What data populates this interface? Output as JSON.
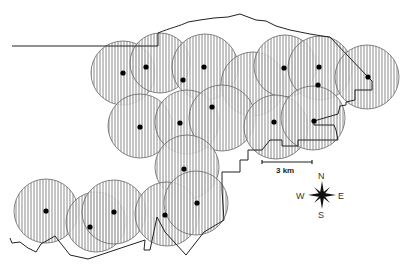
{
  "map": {
    "width": 412,
    "height": 271,
    "hatch_color": "#777777",
    "circle_stroke": "#666666",
    "line_color": "#222222",
    "dot_color": "#000000",
    "circles": [
      {
        "cx": 123,
        "cy": 73,
        "r": 32
      },
      {
        "cx": 160,
        "cy": 63,
        "r": 30
      },
      {
        "cx": 205,
        "cy": 67,
        "r": 33
      },
      {
        "cx": 253,
        "cy": 84,
        "r": 32
      },
      {
        "cx": 285,
        "cy": 66,
        "r": 31
      },
      {
        "cx": 320,
        "cy": 68,
        "r": 32
      },
      {
        "cx": 367,
        "cy": 77,
        "r": 32
      },
      {
        "cx": 140,
        "cy": 126,
        "r": 32
      },
      {
        "cx": 187,
        "cy": 122,
        "r": 32
      },
      {
        "cx": 222,
        "cy": 118,
        "r": 33
      },
      {
        "cx": 276,
        "cy": 127,
        "r": 32
      },
      {
        "cx": 313,
        "cy": 118,
        "r": 32
      },
      {
        "cx": 187,
        "cy": 167,
        "r": 32
      },
      {
        "cx": 46,
        "cy": 211,
        "r": 32
      },
      {
        "cx": 96,
        "cy": 222,
        "r": 30
      },
      {
        "cx": 114,
        "cy": 212,
        "r": 32
      },
      {
        "cx": 167,
        "cy": 214,
        "r": 32
      },
      {
        "cx": 196,
        "cy": 203,
        "r": 32
      }
    ],
    "dots": [
      {
        "x": 123,
        "y": 73
      },
      {
        "x": 146,
        "y": 67
      },
      {
        "x": 204,
        "y": 67
      },
      {
        "x": 183,
        "y": 80
      },
      {
        "x": 140,
        "y": 127
      },
      {
        "x": 180,
        "y": 123
      },
      {
        "x": 212,
        "y": 107
      },
      {
        "x": 184,
        "y": 169
      },
      {
        "x": 284,
        "y": 68
      },
      {
        "x": 319,
        "y": 67
      },
      {
        "x": 318,
        "y": 85
      },
      {
        "x": 368,
        "y": 77
      },
      {
        "x": 274,
        "y": 122
      },
      {
        "x": 314,
        "y": 121
      },
      {
        "x": 46,
        "y": 211
      },
      {
        "x": 90,
        "y": 227
      },
      {
        "x": 114,
        "y": 212
      },
      {
        "x": 165,
        "y": 215
      },
      {
        "x": 197,
        "y": 203
      }
    ],
    "boundary_path": "M12,46 L158,46 L158,33 C170,28 180,26 188,22 L200,20 L214,18 L228,17 L240,14 L256,20 L266,21 L276,26 L290,30 L310,34 L322,36 L330,37 L368,77 L372,81 L372,90 L355,90 L355,100 L346,102 L346,105 L340,106 L338,114 L314,121 L314,125 L334,125 L336,130 L338,140 L298,140 L298,146 L282,146 L282,140 L270,140 L262,150 L248,150 L248,160 L240,160 L240,172 L222,172 L222,190 L224,220 L204,232 L186,255 L165,232 L157,217 L150,250 L144,250 L145,240 L88,259 L70,255 L55,236 L41,244 L36,252 L28,248 L20,242 L12,243 L10,238",
    "scale_bar": {
      "x1": 262,
      "x2": 312,
      "y": 162,
      "label": "3 km"
    },
    "compass": {
      "cx": 322,
      "cy": 195,
      "n": "N",
      "s": "S",
      "e": "E",
      "w": "W"
    }
  }
}
